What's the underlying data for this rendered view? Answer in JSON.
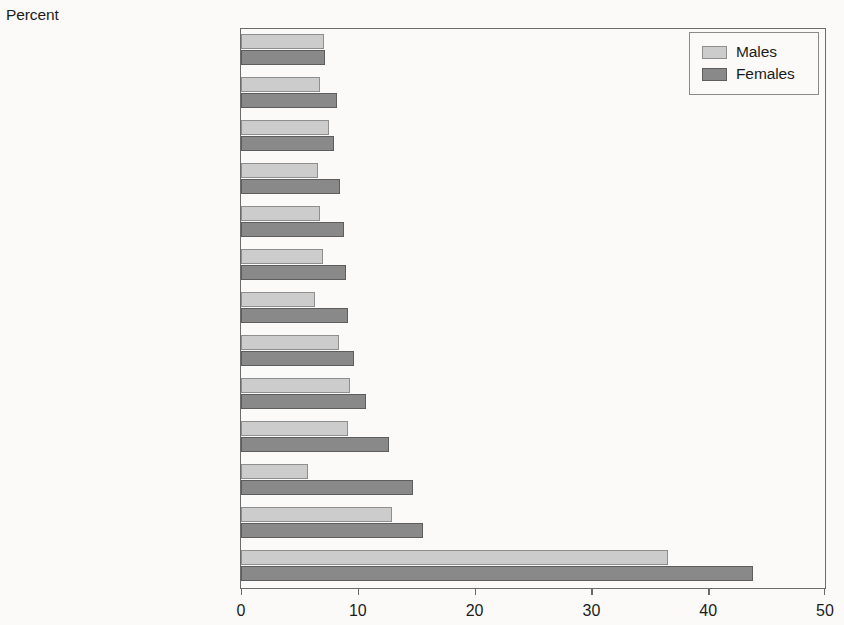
{
  "axis_caption": "Percent",
  "legend": {
    "position": "top-right",
    "entries": [
      {
        "label": "Males",
        "color": "#cccccc"
      },
      {
        "label": "Females",
        "color": "#898989"
      }
    ]
  },
  "chart_data": {
    "type": "bar",
    "orientation": "horizontal",
    "title": "",
    "subtitle": "",
    "xlabel": "Percent",
    "ylabel": "",
    "xlim": [
      0,
      50
    ],
    "xticks": [
      0,
      10,
      20,
      30,
      40,
      50
    ],
    "xticklabels": [
      "0",
      "10",
      "20",
      "30",
      "40",
      "50"
    ],
    "grid": false,
    "legend_entries": [
      "Males",
      "Females"
    ],
    "legend_position": "upper right",
    "categories": [
      "Newfoundland and Labrador",
      "Manitoba",
      "Quebec",
      "Saskatchewan",
      "Ontario",
      "Alberta",
      "British Columbia",
      "New Brunswick",
      "Yukon",
      "Nova Scotia",
      "Prince Edward Island",
      "Northwest Territories",
      "Nunavut"
    ],
    "series": [
      {
        "name": "Males",
        "color": "#cccccc",
        "values": [
          7.1,
          6.8,
          7.5,
          6.6,
          6.8,
          7.0,
          6.3,
          8.4,
          9.3,
          9.2,
          5.7,
          12.9,
          36.6
        ]
      },
      {
        "name": "Females",
        "color": "#898989",
        "values": [
          7.2,
          8.2,
          8.0,
          8.5,
          8.8,
          9.0,
          9.2,
          9.7,
          10.7,
          12.7,
          14.7,
          15.6,
          43.8
        ]
      }
    ]
  }
}
